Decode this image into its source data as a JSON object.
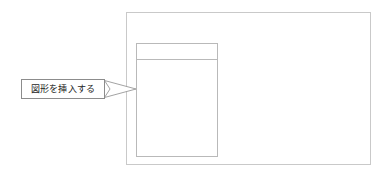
{
  "document": {
    "background_color": "#ffffff",
    "width": 390,
    "height": 177
  },
  "canvas": {
    "name": "slide-canvas",
    "border_color": "#c9c9c9",
    "fill_color": "#ffffff"
  },
  "shape": {
    "name": "inserted-shape",
    "border_color": "#b9b9b9",
    "fill_color": "#ffffff",
    "has_header_divider": true
  },
  "annotation": {
    "label": "図形を挿入する",
    "border_color": "#8c8c8c",
    "fill_color": "#ffffff",
    "text_color": "#1c1c1c",
    "pointer": {
      "name": "callout-tail",
      "direction": "right",
      "stroke_color": "#8c8c8c"
    }
  }
}
